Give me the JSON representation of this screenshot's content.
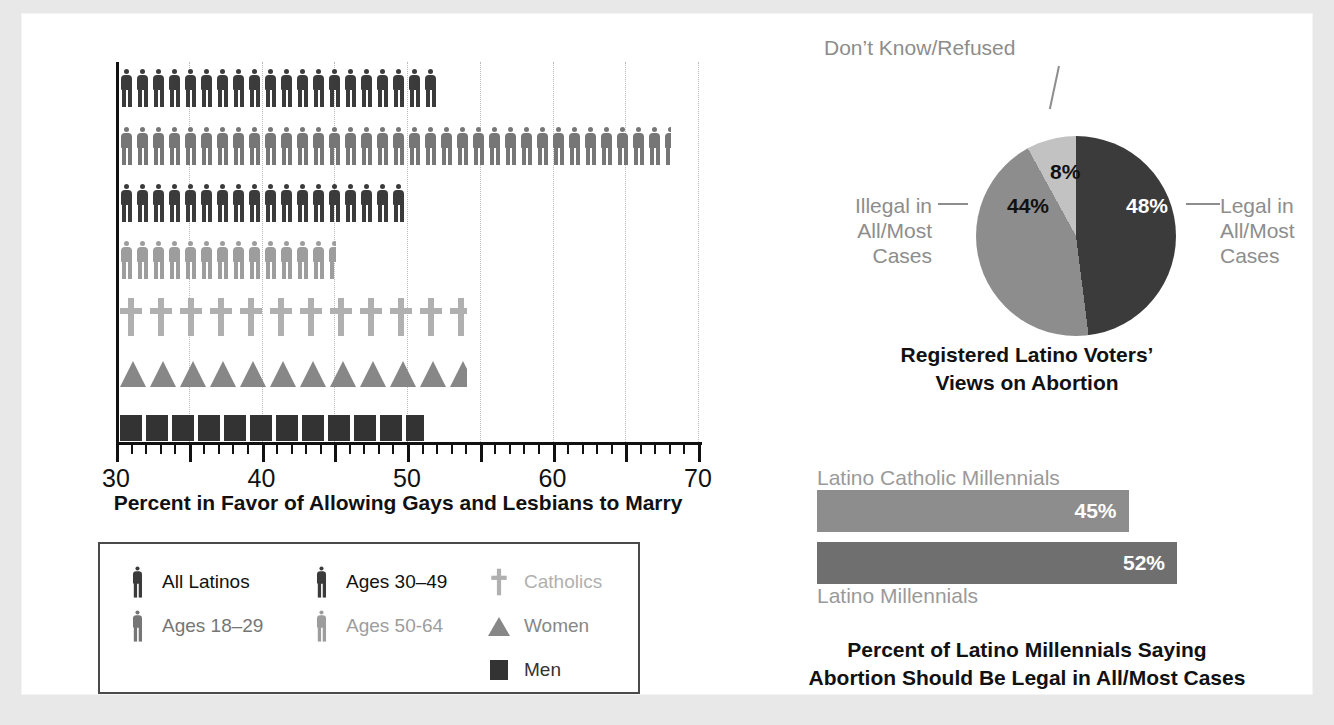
{
  "colors": {
    "all_latinos": "#3b3b3b",
    "ages_18_29": "#767676",
    "ages_30_49": "#3b3b3b",
    "ages_50_64": "#9d9d9d",
    "catholics": "#b0b0b0",
    "women": "#878787",
    "men": "#333333",
    "pie_legal": "#3b3b3b",
    "pie_illegal": "#8d8d8d",
    "pie_dk": "#c2c2c2",
    "bar_catholic": "#8d8d8d",
    "bar_millennial": "#6f6f6f",
    "axis": "#111111",
    "gridline": "#b9b9b9",
    "legend_border": "#4a4a4a",
    "page_background": "#ffffff",
    "canvas_background": "#e8e8e8"
  },
  "pictogram_chart": {
    "axis_title": "Percent in Favor of Allowing Gays and Lesbians to Marry",
    "x_ticks": [
      "30",
      "40",
      "50",
      "60",
      "70"
    ],
    "legend": {
      "columns": [
        [
          {
            "icon": "person-icon",
            "label": "All Latinos",
            "color_key": "all_latinos",
            "label_color": "#111111"
          },
          {
            "icon": "person-icon",
            "label": "Ages 18–29",
            "color_key": "ages_18_29",
            "label_color": "#767676"
          }
        ],
        [
          {
            "icon": "person-icon",
            "label": "Ages 30–49",
            "color_key": "ages_30_49",
            "label_color": "#111111"
          },
          {
            "icon": "person-icon",
            "label": "Ages 50-64",
            "color_key": "ages_50_64",
            "label_color": "#9d9d9d"
          }
        ],
        [
          {
            "icon": "cross-icon",
            "label": "Catholics",
            "color_key": "catholics",
            "label_color": "#b0b0b0"
          },
          {
            "icon": "triangle-icon",
            "label": "Women",
            "color_key": "women",
            "label_color": "#878787"
          },
          {
            "icon": "square-icon",
            "label": "Men",
            "color_key": "men",
            "label_color": "#333333"
          }
        ]
      ]
    }
  },
  "pie_chart": {
    "title_line1": "Registered Latino Voters’",
    "title_line2": "Views on Abortion",
    "callout_top": "Don’t Know/Refused",
    "callout_left_lines": [
      "Illegal in",
      "All/Most",
      "Cases"
    ],
    "callout_right_lines": [
      "Legal in",
      "All/Most",
      "Cases"
    ],
    "values": {
      "legal": "48%",
      "illegal": "44%",
      "dont_know": "8%"
    }
  },
  "bar_chart": {
    "title_line1": "Percent of Latino Millennials Saying",
    "title_line2": "Abortion Should Be Legal in All/Most Cases",
    "top_label": "Latino Catholic Millennials",
    "bottom_label": "Latino Millennials",
    "top_value": "45%",
    "bottom_value": "52%"
  },
  "chart_data": [
    {
      "type": "bar",
      "title": "Percent in Favor of Allowing Gays and Lesbians to Marry",
      "subtitle": "Pictogram (isotype) chart — each glyph ≈ 1 percentage point",
      "xlabel": "Percent in Favor of Allowing Gays and Lesbians to Marry",
      "ylabel": "",
      "xlim": [
        30,
        70
      ],
      "grid": true,
      "grid_axis": "x",
      "legend_position": "below-plot",
      "orientation": "horizontal",
      "categories": [
        "All Latinos",
        "Ages 18–29",
        "Ages 30–49",
        "Ages 50-64",
        "Catholics",
        "Women",
        "Men"
      ],
      "values": [
        52,
        68,
        50,
        45,
        54,
        54,
        51
      ],
      "glyphs": [
        "person",
        "person",
        "person",
        "person",
        "cross",
        "triangle",
        "square"
      ],
      "glyph_counts": [
        22,
        38,
        20,
        15,
        14,
        14,
        13
      ],
      "series_colors": [
        "#3b3b3b",
        "#767676",
        "#3b3b3b",
        "#9d9d9d",
        "#b0b0b0",
        "#878787",
        "#333333"
      ],
      "x_tick_labels": [
        "30",
        "40",
        "50",
        "60",
        "70"
      ],
      "x_tick_values": [
        30,
        40,
        50,
        60,
        70
      ],
      "minor_tick_step": 1,
      "gridline_values": [
        35,
        40,
        45,
        50,
        55,
        60,
        65,
        70
      ]
    },
    {
      "type": "pie",
      "title": "Registered Latino Voters’ Views on Abortion",
      "labels": [
        "Legal in All/Most Cases",
        "Illegal in All/Most Cases",
        "Don’t Know/Refused"
      ],
      "values": [
        48,
        44,
        8
      ],
      "value_labels": [
        "48%",
        "44%",
        "8%"
      ],
      "colors": [
        "#3b3b3b",
        "#8d8d8d",
        "#c2c2c2"
      ],
      "legend_position": "callouts",
      "start_angle_deg": 0,
      "direction": "clockwise"
    },
    {
      "type": "bar",
      "title": "Percent of Latino Millennials Saying Abortion Should Be Legal in All/Most Cases",
      "orientation": "horizontal",
      "categories": [
        "Latino Catholic Millennials",
        "Latino Millennials"
      ],
      "values": [
        45,
        52
      ],
      "value_labels": [
        "45%",
        "52%"
      ],
      "colors": [
        "#8d8d8d",
        "#6f6f6f"
      ],
      "xlim": [
        0,
        52
      ],
      "grid": false,
      "legend_position": "none"
    }
  ]
}
